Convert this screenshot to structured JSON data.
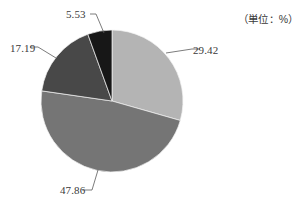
{
  "unit_note": "（単位：%）",
  "chart_data": {
    "type": "pie",
    "title": "",
    "subtitle": "",
    "xlabel": "",
    "ylabel": "",
    "unit": "%",
    "unit_note": "（単位：%）",
    "legend": "none",
    "grid": false,
    "start_angle_deg": 0,
    "direction": "clockwise",
    "categories": [
      "29.42",
      "47.86",
      "17.19",
      "5.53"
    ],
    "values": [
      29.42,
      47.86,
      17.19,
      5.53
    ],
    "labels": [
      "29.42",
      "47.86",
      "17.19",
      "5.53"
    ],
    "colors": [
      "#b4b4b4",
      "#757575",
      "#484848",
      "#171717"
    ],
    "slices": [
      {
        "label": "29.42",
        "value": 29.42,
        "color": "#b4b4b4",
        "start_deg": 0.0,
        "sweep_deg": 105.91,
        "leader": {
          "x1": 166,
          "y1": 53,
          "x2": 192,
          "y2": 49
        }
      },
      {
        "label": "47.86",
        "value": 47.86,
        "color": "#757575",
        "start_deg": 105.91,
        "sweep_deg": 172.3,
        "leader": {
          "x1": 98,
          "y1": 170,
          "x2": 92,
          "y2": 190
        }
      },
      {
        "label": "17.19",
        "value": 17.19,
        "color": "#484848",
        "start_deg": 278.21,
        "sweep_deg": 61.88,
        "leader": {
          "x1": 56,
          "y1": 58,
          "x2": 38,
          "y2": 47
        }
      },
      {
        "label": "5.53",
        "value": 5.53,
        "color": "#171717",
        "start_deg": 340.09,
        "sweep_deg": 19.91,
        "leader": {
          "x1": 104,
          "y1": 33,
          "x2": 96,
          "y2": 14
        }
      }
    ],
    "geometry": {
      "cx": 112,
      "cy": 101,
      "r": 71
    }
  }
}
